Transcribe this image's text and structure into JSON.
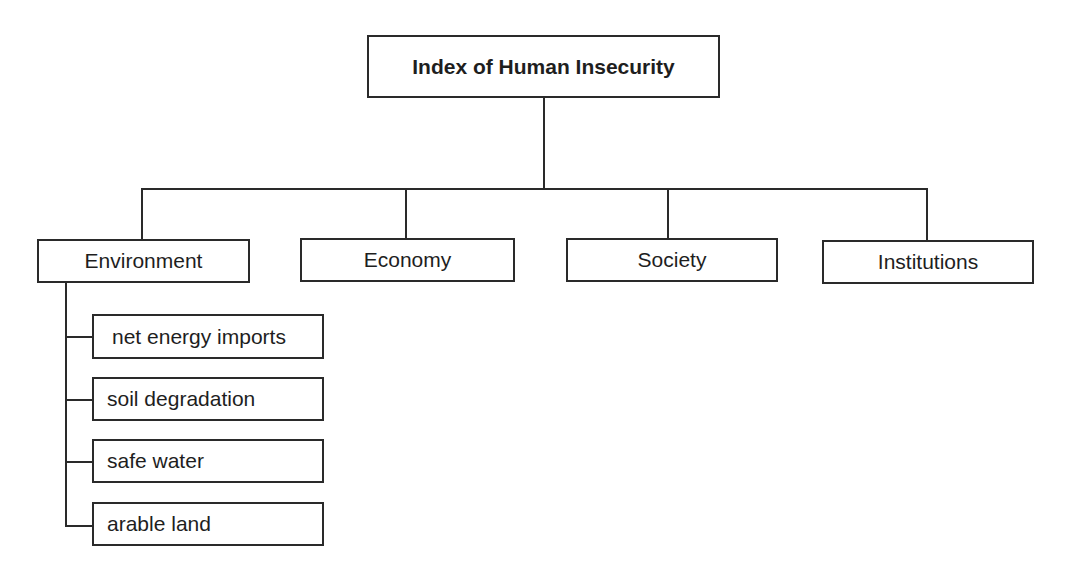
{
  "diagram": {
    "title": "Index of Human Insecurity",
    "categories": [
      {
        "label": "Environment"
      },
      {
        "label": "Economy"
      },
      {
        "label": "Society"
      },
      {
        "label": "Institutions"
      }
    ],
    "environment_indicators": [
      {
        "label": "net energy imports"
      },
      {
        "label": "soil degradation"
      },
      {
        "label": "safe water"
      },
      {
        "label": "arable land"
      }
    ],
    "colors": {
      "line": "#2a2a2a",
      "text": "#1e1e1e",
      "background": "#ffffff"
    }
  }
}
